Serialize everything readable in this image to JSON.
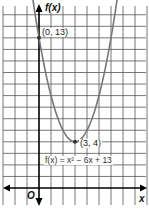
{
  "chart_data": {
    "type": "line",
    "title": "",
    "function": "f(x) = x^2 - 6x + 13",
    "equation_label": "f(x) = x² − 6x + 13",
    "xlabel": "x",
    "ylabel": "f(x)",
    "origin_label": "O",
    "xlim": [
      -3,
      9
    ],
    "ylim": [
      -1,
      15
    ],
    "grid": true,
    "legend": null,
    "points": [
      {
        "x": 0,
        "y": 13,
        "label": "(0, 13)"
      },
      {
        "x": 3,
        "y": 4,
        "label": "(3, 4)"
      }
    ],
    "series": [
      {
        "name": "f(x) = x^2 - 6x + 13",
        "x": [
          -0.5,
          0,
          1,
          2,
          3,
          4,
          5,
          6,
          6.5
        ],
        "values": [
          16.25,
          13,
          8,
          5,
          4,
          5,
          8,
          13,
          16.25
        ]
      }
    ],
    "colors": {
      "curve": "#777777",
      "axes": "#000000",
      "grid": "#555555",
      "points": "#333333"
    }
  }
}
